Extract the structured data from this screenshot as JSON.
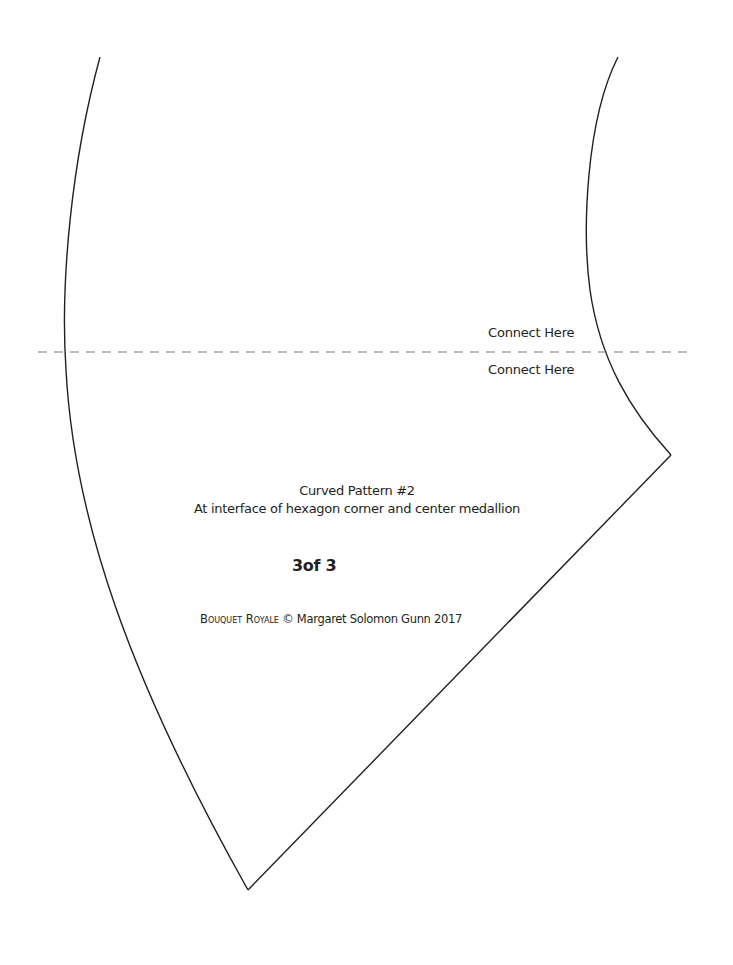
{
  "document": {
    "connect_labels": {
      "above": "Connect Here",
      "below": "Connect Here"
    },
    "pattern_title": "Curved Pattern #2",
    "pattern_subtitle": "At interface of hexagon corner and center medallion",
    "page_count": "3of 3",
    "copyright": {
      "brand": "Bouquet Royale",
      "symbol": "©",
      "author_year": "Margaret Solomon Gunn 2017"
    }
  },
  "colors": {
    "line": "#231f20",
    "dash": "#7a7a7a",
    "background": "#ffffff"
  }
}
